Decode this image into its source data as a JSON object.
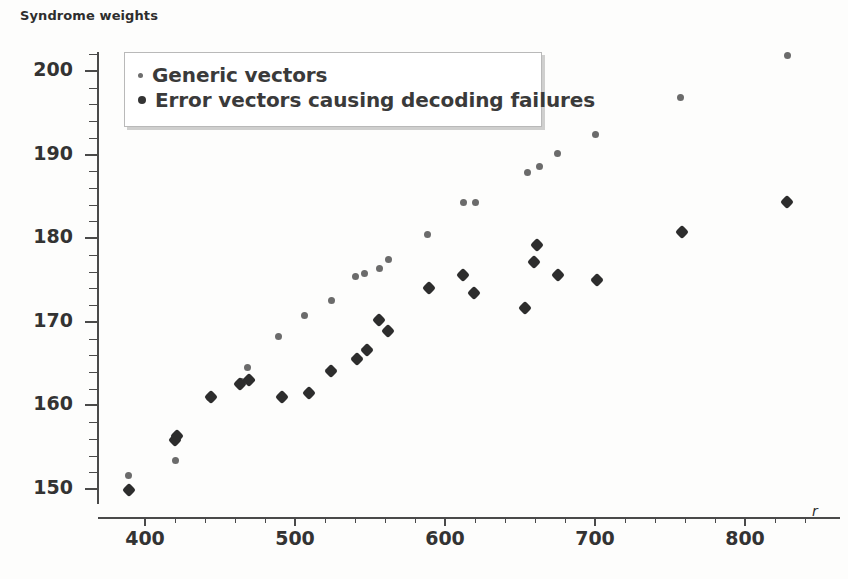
{
  "chart_data": {
    "type": "scatter",
    "title": "",
    "ylabel": "Syndrome weights",
    "xlabel": "r",
    "xlim": [
      370,
      845
    ],
    "ylim": [
      147,
      204
    ],
    "grid": false,
    "legend_position": "top-left",
    "xticks_major": [
      400,
      500,
      600,
      700,
      800
    ],
    "xticks_minor": [
      420,
      440,
      460,
      480,
      520,
      540,
      560,
      580,
      620,
      640,
      660,
      680,
      720,
      740,
      760,
      780,
      820,
      840
    ],
    "yticks_major": [
      150,
      160,
      170,
      180,
      190,
      200
    ],
    "yticks_minor": [
      152,
      154,
      156,
      158,
      162,
      164,
      166,
      168,
      172,
      174,
      176,
      178,
      182,
      184,
      186,
      188,
      192,
      194,
      196,
      198,
      202
    ],
    "series": [
      {
        "name": "Generic vectors",
        "marker": "small-dot",
        "color": "#6b6b6b",
        "points": [
          [
            389,
            151.6
          ],
          [
            420,
            153.4
          ],
          [
            443,
            161.0
          ],
          [
            464,
            162.9
          ],
          [
            468,
            164.5
          ],
          [
            489,
            168.3
          ],
          [
            506,
            170.7
          ],
          [
            524,
            172.6
          ],
          [
            540,
            175.4
          ],
          [
            546,
            175.8
          ],
          [
            556,
            176.4
          ],
          [
            562,
            177.5
          ],
          [
            588,
            180.4
          ],
          [
            612,
            184.3
          ],
          [
            620,
            184.3
          ],
          [
            655,
            187.9
          ],
          [
            663,
            188.6
          ],
          [
            675,
            190.1
          ],
          [
            700,
            192.4
          ],
          [
            757,
            196.8
          ],
          [
            828,
            201.9
          ]
        ]
      },
      {
        "name": "Error vectors causing decoding failures",
        "marker": "diamond",
        "color": "#2d2d2d",
        "points": [
          [
            389,
            149.9
          ],
          [
            420,
            155.9
          ],
          [
            421,
            156.3
          ],
          [
            444,
            161.0
          ],
          [
            463,
            162.6
          ],
          [
            469,
            163.0
          ],
          [
            491,
            161.0
          ],
          [
            509,
            161.5
          ],
          [
            524,
            164.1
          ],
          [
            541,
            165.6
          ],
          [
            548,
            166.6
          ],
          [
            556,
            170.2
          ],
          [
            562,
            168.9
          ],
          [
            589,
            174.0
          ],
          [
            612,
            175.6
          ],
          [
            619,
            173.4
          ],
          [
            653,
            171.7
          ],
          [
            659,
            177.1
          ],
          [
            661,
            179.2
          ],
          [
            675,
            175.6
          ],
          [
            701,
            175.0
          ],
          [
            758,
            180.7
          ],
          [
            828,
            184.3
          ]
        ]
      }
    ]
  },
  "axis": {
    "y_title": "Syndrome weights",
    "x_title": "r"
  },
  "legend": {
    "entries": [
      {
        "label": "Generic vectors",
        "marker": "small-dot"
      },
      {
        "label": "Error vectors causing decoding failures",
        "marker": "large-dot"
      }
    ]
  },
  "colors": {
    "generic": "#6b6b6b",
    "error": "#2d2d2d",
    "axis": "#4a4a4a",
    "text": "#333333",
    "background": "#fdfdfc"
  }
}
